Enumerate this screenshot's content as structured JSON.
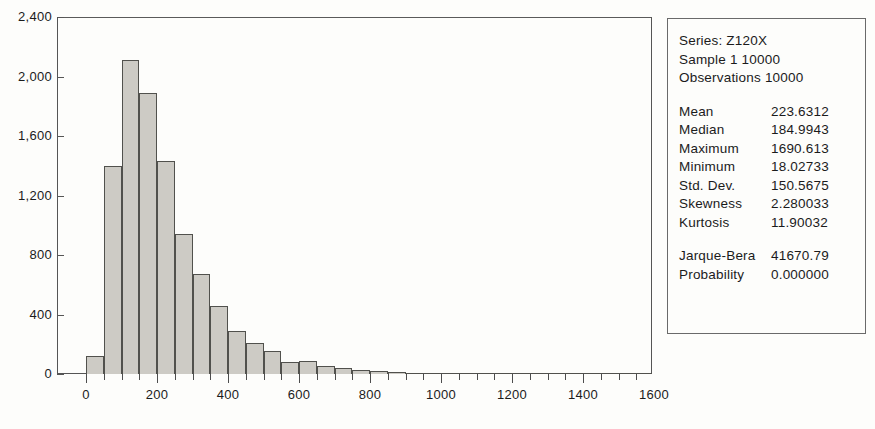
{
  "chart_data": {
    "type": "bar",
    "title": "",
    "xlabel": "",
    "ylabel": "",
    "ylim": [
      0,
      2400
    ],
    "xlim": [
      0,
      1750
    ],
    "bin_width": 50,
    "grid": false,
    "yticks": [
      "0",
      "400",
      "800",
      "1,200",
      "1,600",
      "2,000",
      "2,400"
    ],
    "ytick_values": [
      0,
      400,
      800,
      1200,
      1600,
      2000,
      2400
    ],
    "xticks": [
      "0",
      "200",
      "400",
      "600",
      "800",
      "1000",
      "1200",
      "1400",
      "1600"
    ],
    "xtick_values": [
      0,
      200,
      400,
      600,
      800,
      1000,
      1200,
      1400,
      1600
    ],
    "bin_starts": [
      0,
      50,
      100,
      150,
      200,
      250,
      300,
      350,
      400,
      450,
      500,
      550,
      600,
      650,
      700,
      750,
      800,
      850,
      900,
      950,
      1000,
      1050,
      1100,
      1150,
      1200,
      1250,
      1300,
      1350,
      1400,
      1450,
      1500,
      1550,
      1600,
      1650
    ],
    "values": [
      120,
      1400,
      2110,
      1890,
      1430,
      940,
      670,
      460,
      290,
      210,
      155,
      80,
      85,
      55,
      40,
      25,
      20,
      12,
      10,
      8,
      7,
      5,
      4,
      3,
      3,
      2,
      2,
      2,
      1,
      1,
      1,
      1,
      1,
      1
    ],
    "bar_fill": "#cdcbc5",
    "bar_edge": "#51514d"
  },
  "stats_box": {
    "series_line": "Series: Z120X",
    "sample_line": "Sample 1 10000",
    "observations_line": "Observations 10000",
    "rows": [
      {
        "label": "Mean",
        "value": "223.6312"
      },
      {
        "label": "Median",
        "value": "184.9943"
      },
      {
        "label": "Maximum",
        "value": "1690.613"
      },
      {
        "label": "Minimum",
        "value": "18.02733"
      },
      {
        "label": "Std. Dev.",
        "value": "150.5675"
      },
      {
        "label": "Skewness",
        "value": "2.280033"
      },
      {
        "label": "Kurtosis",
        "value": "11.90032"
      }
    ],
    "test_rows": [
      {
        "label": "Jarque-Bera",
        "value": "41670.79"
      },
      {
        "label": "Probability",
        "value": "0.000000"
      }
    ]
  }
}
